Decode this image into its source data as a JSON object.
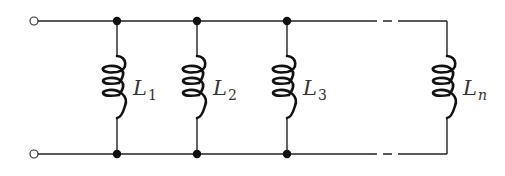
{
  "diagram": {
    "terminals": [
      {
        "name": "top-terminal",
        "x": 34,
        "y": 21
      },
      {
        "name": "bottom-terminal",
        "x": 34,
        "y": 154
      }
    ],
    "rails": {
      "top_y": 21,
      "bottom_y": 154
    },
    "inductors": [
      {
        "symbol": "L",
        "subscript": "1",
        "x": 117,
        "junction": true
      },
      {
        "symbol": "L",
        "subscript": "2",
        "x": 197,
        "junction": true
      },
      {
        "symbol": "L",
        "subscript": "3",
        "x": 287,
        "junction": true
      },
      {
        "symbol": "L",
        "subscript": "n",
        "x": 447,
        "junction": false
      }
    ],
    "continuation": "dashed",
    "colors": {
      "line": "#222222",
      "background": "#ffffff"
    }
  }
}
